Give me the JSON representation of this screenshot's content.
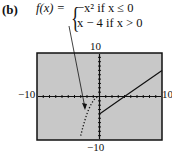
{
  "panel_label": "(b)",
  "function": {
    "lhs": "f(x) = ",
    "case1": "−x² if x ≤ 0",
    "case2": "x − 4 if x > 0"
  },
  "window": {
    "ymax_label": "10",
    "ymin_label": "−10",
    "xmin_label": "−10",
    "xmax_label": "10"
  },
  "chart_data": {
    "type": "line",
    "xlabel": "",
    "ylabel": "",
    "xlim": [
      -10,
      10
    ],
    "ylim": [
      -10,
      10
    ],
    "grid": false,
    "screen_background": "#c8c8c8",
    "series": [
      {
        "name": "−x² (x ≤ 0)",
        "style": "dotted",
        "x": [
          -3,
          -2.5,
          -2,
          -1.5,
          -1,
          -0.5,
          0
        ],
        "y": [
          -9,
          -6.25,
          -4,
          -2.25,
          -1,
          -0.25,
          0
        ]
      },
      {
        "name": "x − 4 (x > 0)",
        "style": "solid",
        "x": [
          0,
          4,
          10
        ],
        "y": [
          -4,
          0,
          6
        ]
      }
    ],
    "annotations": [
      {
        "text": "arrow from formula to parabola branch",
        "target": [
          -2,
          -4
        ]
      }
    ]
  }
}
